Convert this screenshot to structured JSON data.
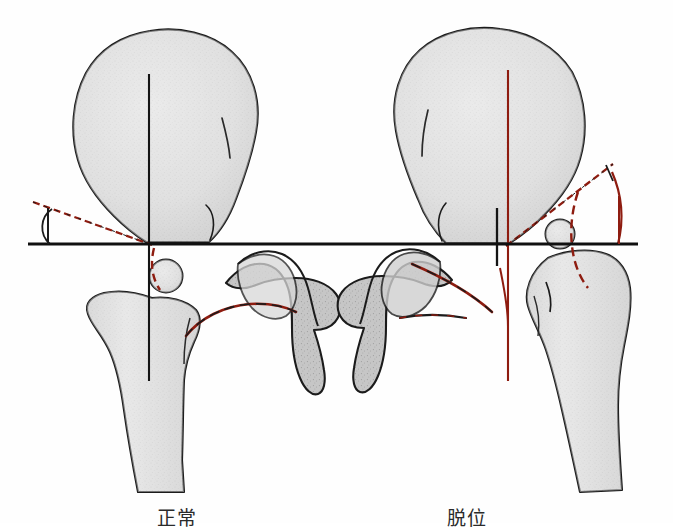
{
  "figure": {
    "background_color": "#fefefe",
    "bone_fill": "#e2e2e2",
    "bone_fill_dark": "#bdbdbd",
    "outline_color": "#1a1a1a",
    "marker_color": "#8e1c10",
    "reference_line_color": "#101010"
  },
  "labels": {
    "left_label": "正常",
    "right_label": "脱位"
  },
  "panels": [
    {
      "id": "left-panel",
      "caption": "正常",
      "condition": "normal",
      "acetabular_index_deg": 14,
      "shenton_line": "continuous",
      "ossification_center_position": "below-hilgenreiner-line",
      "structures": [
        "ilium",
        "femoral-head-ossification-center",
        "proximal-femur",
        "ischium-pubis"
      ]
    },
    {
      "id": "right-panel",
      "caption": "脱位",
      "condition": "dislocated",
      "acetabular_index_deg": 42,
      "shenton_line": "broken",
      "ossification_center_position": "above-hilgenreiner-line",
      "structures": [
        "ilium",
        "femoral-head-ossification-center",
        "proximal-femur",
        "ischium-pubis"
      ]
    }
  ],
  "reference_lines": {
    "hilgenreiner": {
      "name": "Hilgenreiner line",
      "orientation": "horizontal",
      "y": 244,
      "x_start": 28,
      "x_end": 638,
      "color": "#101010"
    },
    "perkin_left": {
      "name": "Perkin line (left)",
      "orientation": "vertical",
      "x": 149,
      "color": "#101010"
    },
    "perkin_right": {
      "name": "Perkin line (right)",
      "orientation": "vertical",
      "x": 508,
      "color": "#8e1c10"
    },
    "acetabular_roof_left": {
      "name": "Acetabular roof line (left)",
      "color": "#8e1c10"
    },
    "acetabular_roof_right": {
      "name": "Acetabular roof line (right)",
      "color": "#8e1c10"
    },
    "shenton_left": {
      "name": "Shenton line (left)",
      "state": "continuous",
      "color": "#8e1c10"
    },
    "shenton_right": {
      "name": "Shenton line (right)",
      "state": "broken",
      "color": "#8e1c10"
    }
  }
}
